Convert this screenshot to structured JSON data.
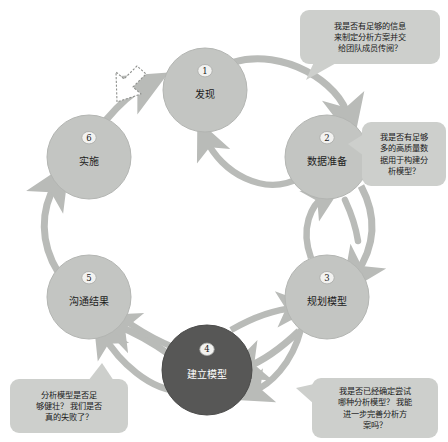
{
  "diagram": {
    "colors": {
      "node_fill": "#c3c5c2",
      "node_fill_active": "#575756",
      "node_stroke": "#b3b5b2",
      "arrow": "#b9bbb8",
      "bubble_fill": "#cdcfcc",
      "badge_fill": "#f2f2f0",
      "text_dark": "#1c1c1c",
      "text_light": "#ffffff",
      "background": "#ffffff"
    },
    "nodes": [
      {
        "num": "1",
        "label": "发现",
        "cx": 205,
        "cy": 90,
        "r": 42,
        "active": false
      },
      {
        "num": "2",
        "label": "数据准备",
        "cx": 327,
        "cy": 157,
        "r": 42,
        "active": false
      },
      {
        "num": "3",
        "label": "规划模型",
        "cx": 327,
        "cy": 297,
        "r": 42,
        "active": false
      },
      {
        "num": "4",
        "label": "建立模型",
        "cx": 207,
        "cy": 370,
        "r": 45,
        "active": true
      },
      {
        "num": "5",
        "label": "沟通结果",
        "cx": 89,
        "cy": 297,
        "r": 42,
        "active": false
      },
      {
        "num": "6",
        "label": "实施",
        "cx": 89,
        "cy": 157,
        "r": 42,
        "active": false
      }
    ],
    "bubbles": [
      {
        "id": "bubble-discovery",
        "x": 300,
        "y": 10,
        "w": 140,
        "h": 54,
        "tail": "bottom-left",
        "lines": [
          "我是否有足够的信息",
          "来制定分析方案并交",
          "给团队成员传阅？"
        ]
      },
      {
        "id": "bubble-data-prep",
        "x": 362,
        "y": 122,
        "w": 84,
        "h": 64,
        "tail": "left",
        "lines": [
          "我是否有足够",
          "多的高质量数",
          "据用于构建分",
          "析模型？"
        ]
      },
      {
        "id": "bubble-model-planning",
        "x": 312,
        "y": 378,
        "w": 126,
        "h": 60,
        "tail": "left-top",
        "lines": [
          "我是否已经确定尝试",
          "哪种分析模型？ 我能",
          "进一步完善分析方",
          "案吗？"
        ]
      },
      {
        "id": "bubble-communicate",
        "x": 10,
        "y": 379,
        "w": 118,
        "h": 54,
        "tail": "top-right",
        "lines": [
          "分析模型是否足",
          "够健壮？ 我们是否",
          "真的失败了？"
        ]
      }
    ],
    "pointer": {
      "name": "cursor-arrow",
      "x": 131,
      "y": 77
    }
  }
}
